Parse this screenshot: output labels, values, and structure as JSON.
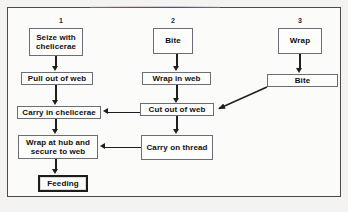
{
  "diagram": {
    "type": "flowchart",
    "columns": [
      {
        "label": "1"
      },
      {
        "label": "2"
      },
      {
        "label": "3"
      }
    ],
    "nodes": [
      {
        "id": "seize-with-chelicerae",
        "text": "Seize with\nchelicerae",
        "column": 1,
        "terminal": false
      },
      {
        "id": "pull-out-of-web",
        "text": "Pull out of web",
        "column": 1,
        "terminal": false
      },
      {
        "id": "carry-in-chelicerae",
        "text": "Carry in chelicerae",
        "column": 1,
        "terminal": false
      },
      {
        "id": "wrap-at-hub-and-secure-to-web",
        "text": "Wrap at hub and\nsecure to web",
        "column": 1,
        "terminal": false
      },
      {
        "id": "feeding",
        "text": "Feeding",
        "column": 1,
        "terminal": true
      },
      {
        "id": "bite-2",
        "text": "Bite",
        "column": 2,
        "terminal": false
      },
      {
        "id": "wrap-in-web",
        "text": "Wrap in web",
        "column": 2,
        "terminal": false
      },
      {
        "id": "cut-out-of-web",
        "text": "Cut out of web",
        "column": 2,
        "terminal": false
      },
      {
        "id": "carry-on-thread",
        "text": "Carry on thread",
        "column": 2,
        "terminal": false
      },
      {
        "id": "wrap-3",
        "text": "Wrap",
        "column": 3,
        "terminal": false
      },
      {
        "id": "bite-3",
        "text": "Bite",
        "column": 3,
        "terminal": false
      }
    ],
    "edges": [
      {
        "from": "seize-with-chelicerae",
        "to": "pull-out-of-web",
        "style": "vertical"
      },
      {
        "from": "pull-out-of-web",
        "to": "carry-in-chelicerae",
        "style": "vertical"
      },
      {
        "from": "carry-in-chelicerae",
        "to": "wrap-at-hub-and-secure-to-web",
        "style": "vertical"
      },
      {
        "from": "wrap-at-hub-and-secure-to-web",
        "to": "feeding",
        "style": "vertical"
      },
      {
        "from": "bite-2",
        "to": "wrap-in-web",
        "style": "vertical"
      },
      {
        "from": "wrap-in-web",
        "to": "cut-out-of-web",
        "style": "vertical"
      },
      {
        "from": "cut-out-of-web",
        "to": "carry-on-thread",
        "style": "vertical"
      },
      {
        "from": "cut-out-of-web",
        "to": "carry-in-chelicerae",
        "style": "horizontal-left"
      },
      {
        "from": "carry-on-thread",
        "to": "wrap-at-hub-and-secure-to-web",
        "style": "horizontal-left"
      },
      {
        "from": "wrap-3",
        "to": "bite-3",
        "style": "vertical"
      },
      {
        "from": "bite-3",
        "to": "cut-out-of-web",
        "style": "diagonal-down-left"
      }
    ],
    "colors": {
      "line": "#1f1f1f",
      "node_border": "#6d6d78",
      "node_fill": "#fdfdfc",
      "terminal_border": "#1d1d1d",
      "frame_border": "#4a4a4a",
      "page_background": "#f4f3f1"
    }
  }
}
